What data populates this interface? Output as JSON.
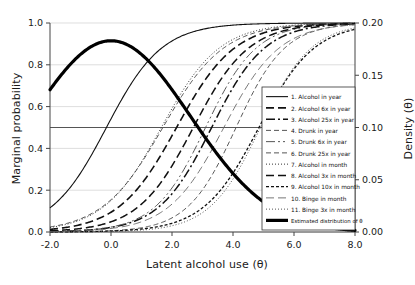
{
  "chart_data": {
    "type": "line",
    "title": "",
    "xlabel": "Latent alcohol use (θ)",
    "ylabel": "Marginal probability",
    "ylabel_right": "Density (θ)",
    "xlim": [
      -2.0,
      8.0
    ],
    "ylim": [
      0.0,
      1.0
    ],
    "ylim_right": [
      0.0,
      0.2
    ],
    "xticks": [
      "-2.0",
      "0.0",
      "2.0",
      "4.0",
      "6.0",
      "8.0"
    ],
    "xtick_values": [
      -2.0,
      0.0,
      2.0,
      4.0,
      6.0,
      8.0
    ],
    "yticks": [
      "0.0",
      "0.2",
      "0.4",
      "0.6",
      "0.8",
      "1.0"
    ],
    "ytick_values": [
      0.0,
      0.2,
      0.4,
      0.6,
      0.8,
      1.0
    ],
    "yticks_right": [
      "0.00",
      "0.05",
      "0.10",
      "0.15",
      "0.20"
    ],
    "ytick_values_right": [
      0.0,
      0.05,
      0.1,
      0.15,
      0.2
    ],
    "grid": true,
    "grid_orientation": "horizontal",
    "reference_line": {
      "axis": "y",
      "value": 0.5,
      "color": "#555555"
    },
    "legend_position": "bottom-right",
    "background": "#ffffff",
    "line_color": "#111111",
    "series": [
      {
        "name": "1. Alcohol in year",
        "dash": "solid",
        "width": 1.1,
        "color": "#111111",
        "threshold": -0.15,
        "slope": 1.1
      },
      {
        "name": "2. Alcohol 6x in year",
        "dash": "longdash",
        "width": 1.6,
        "color": "#111111",
        "threshold": 2.15,
        "slope": 1.05
      },
      {
        "name": "3. Alcohol 25x in year",
        "dash": "dashdot",
        "width": 1.5,
        "color": "#111111",
        "threshold": 3.3,
        "slope": 1.15
      },
      {
        "name": "4. Drunk in year",
        "dash": "dashed",
        "width": 1.0,
        "color": "#555555",
        "threshold": 1.7,
        "slope": 1.0
      },
      {
        "name": "5. Drunk 6x in year",
        "dash": "dashdotdot",
        "width": 1.0,
        "color": "#555555",
        "threshold": 3.1,
        "slope": 1.2
      },
      {
        "name": "6. Drunk 25x in year",
        "dash": "dashed",
        "width": 1.0,
        "color": "#555555",
        "threshold": 4.1,
        "slope": 1.25
      },
      {
        "name": "7. Alcohol in month",
        "dash": "dotted",
        "width": 1.0,
        "color": "#333333",
        "threshold": 1.65,
        "slope": 1.05
      },
      {
        "name": "8. Alcohol 3x in month",
        "dash": "longdash",
        "width": 1.5,
        "color": "#111111",
        "threshold": 2.7,
        "slope": 1.1
      },
      {
        "name": "9. Alcohol 10x in month",
        "dash": "shortdash",
        "width": 1.3,
        "color": "#111111",
        "threshold": 4.85,
        "slope": 1.1
      },
      {
        "name": "10. Binge in month",
        "dash": "longdash",
        "width": 0.9,
        "color": "#666666",
        "threshold": 3.7,
        "slope": 1.1
      },
      {
        "name": "11. Binge 3x in month",
        "dash": "dotted",
        "width": 1.0,
        "color": "#555555",
        "threshold": 4.9,
        "slope": 1.2
      }
    ],
    "density": {
      "name": "Estimated distribution of θ",
      "dash": "solid",
      "width": 3.2,
      "color": "#000000",
      "mean": 0.0,
      "sd": 2.6,
      "peak_probability_scale": 0.915,
      "peak_density": 0.183,
      "value_at_xmin": 0.6,
      "value_at_xmax": 0.09
    }
  },
  "legend": {
    "items": [
      "1. Alcohol in year",
      "2. Alcohol 6x in year",
      "3. Alcohol 25x in year",
      "4. Drunk in year",
      "5. Drunk 6x in year",
      "6. Drunk 25x in year",
      "7. Alcohol in month",
      "8. Alcohol 3x in month",
      "9. Alcohol 10x in month",
      "10. Binge in month",
      "11. Binge 3x in month",
      "Estimated distribution of θ"
    ]
  }
}
